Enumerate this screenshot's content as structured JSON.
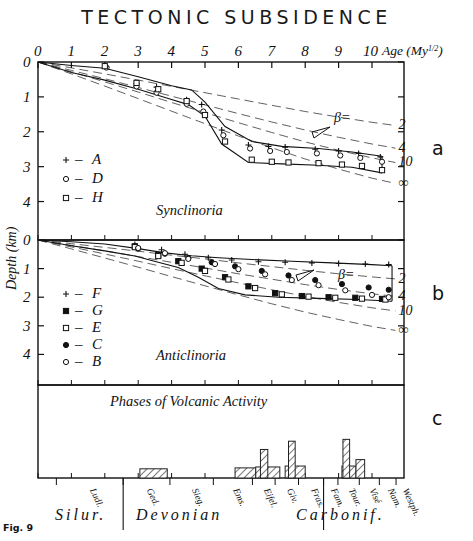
{
  "figure": {
    "title": "TECTONIC SUBSIDENCE",
    "fig_number": "Fig. 9",
    "x_axis_label": "Age (My",
    "x_axis_label_sup": "1/2",
    "x_axis_label_close": ")",
    "y_axis_label": "Depth (km)",
    "x_ticks": [
      "0",
      "1",
      "2",
      "3",
      "4",
      "5",
      "6",
      "7",
      "8",
      "9",
      "10"
    ],
    "y_ticks": [
      "0",
      "1",
      "2",
      "3",
      "4"
    ],
    "panel_letters": [
      "a",
      "b",
      "c"
    ]
  },
  "chart_data": {
    "type": "line",
    "title": "TECTONIC SUBSIDENCE",
    "xlabel": "Age (My^1/2)",
    "ylabel": "Depth (km)",
    "xlim": [
      0,
      11.1
    ],
    "ylim_panels_ab": [
      0,
      4.3
    ],
    "grid": false,
    "panels": [
      {
        "letter": "a",
        "caption": "Synclinoria",
        "legend_position": "inner-left",
        "legend": [
          {
            "symbol": "plus",
            "label": "A"
          },
          {
            "symbol": "open-circle",
            "label": "D"
          },
          {
            "symbol": "open-square",
            "label": "H"
          }
        ],
        "beta_label": "β=",
        "beta_values": [
          "2",
          "4",
          "10",
          "∞"
        ],
        "beta_curves": [
          {
            "name": "2",
            "x": [
              0,
              1,
              2,
              3,
              4,
              5,
              6,
              7,
              8,
              9,
              10,
              10.7
            ],
            "y": [
              0,
              0.17,
              0.34,
              0.52,
              0.7,
              0.88,
              1.06,
              1.24,
              1.42,
              1.58,
              1.73,
              1.82
            ]
          },
          {
            "name": "4",
            "x": [
              0,
              1,
              2,
              3,
              4,
              5,
              6,
              7,
              8,
              9,
              10,
              10.7
            ],
            "y": [
              0,
              0.24,
              0.48,
              0.73,
              0.98,
              1.23,
              1.48,
              1.72,
              1.95,
              2.16,
              2.35,
              2.47
            ]
          },
          {
            "name": "10",
            "x": [
              0,
              1,
              2,
              3,
              4,
              5,
              6,
              7,
              8,
              9,
              10,
              10.7
            ],
            "y": [
              0,
              0.28,
              0.57,
              0.86,
              1.16,
              1.45,
              1.74,
              2.02,
              2.29,
              2.53,
              2.75,
              2.88
            ]
          },
          {
            "name": "∞",
            "x": [
              0,
              1,
              2,
              3,
              4,
              5,
              6,
              7,
              8,
              9,
              10,
              10.7
            ],
            "y": [
              0,
              0.34,
              0.69,
              1.05,
              1.41,
              1.77,
              2.12,
              2.46,
              2.78,
              3.07,
              3.33,
              3.48
            ]
          }
        ],
        "envelope_upper": {
          "x": [
            0,
            1.0,
            2.0,
            3.0,
            4.0,
            4.6,
            5.0,
            5.6,
            6.4,
            7.3,
            8.4,
            9.4,
            10.3
          ],
          "y": [
            0,
            0.1,
            0.18,
            0.42,
            0.68,
            0.8,
            1.15,
            1.85,
            2.28,
            2.42,
            2.48,
            2.58,
            2.7
          ]
        },
        "envelope_lower": {
          "x": [
            0,
            1.0,
            2.0,
            3.0,
            3.9,
            4.5,
            5.0,
            5.5,
            6.3,
            7.3,
            8.4,
            9.4,
            10.3
          ],
          "y": [
            0,
            0.3,
            0.52,
            0.78,
            1.05,
            1.22,
            1.55,
            2.35,
            2.88,
            2.92,
            2.96,
            3.02,
            3.18
          ]
        },
        "series": [
          {
            "name": "A",
            "symbol": "plus",
            "x": [
              2.05,
              2.95,
              3.55,
              4.45,
              4.9,
              5.5,
              6.3,
              6.9,
              7.4,
              8.3,
              9.0,
              9.6,
              10.25
            ],
            "y": [
              0.14,
              0.62,
              0.72,
              1.08,
              1.22,
              1.95,
              2.38,
              2.42,
              2.44,
              2.5,
              2.55,
              2.62,
              2.72
            ]
          },
          {
            "name": "D",
            "symbol": "open-circle",
            "x": [
              2.05,
              2.95,
              3.55,
              4.45,
              4.95,
              5.55,
              6.35,
              6.95,
              7.45,
              8.35,
              9.05,
              9.65,
              10.3
            ],
            "y": [
              0.16,
              0.7,
              0.88,
              1.2,
              1.42,
              2.1,
              2.48,
              2.55,
              2.58,
              2.62,
              2.68,
              2.75,
              2.86
            ]
          },
          {
            "name": "H",
            "symbol": "open-square",
            "x": [
              2.0,
              2.95,
              3.6,
              4.45,
              5.0,
              5.6,
              6.4,
              7.0,
              7.5,
              8.4,
              9.1,
              9.7,
              10.3
            ],
            "y": [
              0.12,
              0.6,
              0.78,
              1.12,
              1.52,
              2.28,
              2.8,
              2.86,
              2.88,
              2.9,
              2.94,
              2.98,
              3.1
            ]
          }
        ]
      },
      {
        "letter": "b",
        "caption": "Anticlinoria",
        "legend_position": "inner-left",
        "legend": [
          {
            "symbol": "plus",
            "label": "F"
          },
          {
            "symbol": "filled-square",
            "label": "G"
          },
          {
            "symbol": "open-square",
            "label": "E"
          },
          {
            "symbol": "filled-circle",
            "label": "C"
          },
          {
            "symbol": "open-circle",
            "label": "B"
          }
        ],
        "beta_label": "β=",
        "beta_values": [
          "2",
          "4",
          "10",
          "∞"
        ],
        "beta_curves": [
          {
            "name": "2",
            "x": [
              0,
              1,
              2,
              3,
              4,
              5,
              6,
              7,
              8,
              9,
              10,
              10.7
            ],
            "y": [
              0,
              0.13,
              0.26,
              0.39,
              0.53,
              0.66,
              0.8,
              0.93,
              1.06,
              1.18,
              1.29,
              1.36
            ]
          },
          {
            "name": "4",
            "x": [
              0,
              1,
              2,
              3,
              4,
              5,
              6,
              7,
              8,
              9,
              10,
              10.7
            ],
            "y": [
              0,
              0.19,
              0.38,
              0.58,
              0.78,
              0.98,
              1.18,
              1.37,
              1.56,
              1.73,
              1.88,
              1.97
            ]
          },
          {
            "name": "10",
            "x": [
              0,
              1,
              2,
              3,
              4,
              5,
              6,
              7,
              8,
              9,
              10,
              10.7
            ],
            "y": [
              0,
              0.24,
              0.49,
              0.74,
              1.0,
              1.25,
              1.5,
              1.74,
              1.97,
              2.18,
              2.37,
              2.48
            ]
          },
          {
            "name": "∞",
            "x": [
              0,
              1,
              2,
              3,
              4,
              5,
              6,
              7,
              8,
              9,
              10,
              10.7
            ],
            "y": [
              0,
              0.31,
              0.63,
              0.95,
              1.28,
              1.6,
              1.92,
              2.23,
              2.52,
              2.78,
              3.02,
              3.16
            ]
          }
        ],
        "envelope_upper": {
          "x": [
            0,
            1.0,
            2.0,
            3.0,
            3.8,
            4.6,
            5.4,
            6.4,
            7.6,
            8.8,
            10.0,
            10.6
          ],
          "y": [
            0,
            0.06,
            0.14,
            0.3,
            0.45,
            0.55,
            0.62,
            0.68,
            0.74,
            0.8,
            0.86,
            0.9
          ]
        },
        "envelope_lower": {
          "x": [
            0,
            1.0,
            2.0,
            2.9,
            3.6,
            4.2,
            4.8,
            5.4,
            6.2,
            7.2,
            8.4,
            9.6,
            10.6
          ],
          "y": [
            0,
            0.2,
            0.38,
            0.56,
            0.78,
            0.96,
            1.3,
            1.7,
            1.92,
            2.0,
            2.04,
            2.08,
            2.14
          ]
        },
        "series": [
          {
            "name": "F",
            "symbol": "plus",
            "x": [
              2.9,
              3.7,
              4.4,
              5.1,
              5.8,
              6.6,
              7.4,
              8.2,
              9.0,
              9.8,
              10.5
            ],
            "y": [
              0.16,
              0.34,
              0.5,
              0.62,
              0.7,
              0.76,
              0.78,
              0.8,
              0.82,
              0.84,
              0.86
            ]
          },
          {
            "name": "G",
            "symbol": "filled-square",
            "x": [
              2.9,
              3.6,
              4.2,
              4.9,
              5.6,
              6.3,
              7.1,
              7.9,
              8.7,
              9.5,
              10.3
            ],
            "y": [
              0.22,
              0.52,
              0.74,
              1.0,
              1.3,
              1.62,
              1.86,
              1.96,
              2.0,
              2.02,
              2.06
            ]
          },
          {
            "name": "E",
            "symbol": "open-square",
            "x": [
              2.9,
              3.6,
              4.3,
              5.0,
              5.7,
              6.5,
              7.3,
              8.1,
              8.9,
              9.7,
              10.4
            ],
            "y": [
              0.25,
              0.56,
              0.8,
              1.08,
              1.38,
              1.68,
              1.9,
              1.98,
              2.02,
              2.05,
              2.08
            ]
          },
          {
            "name": "C",
            "symbol": "filled-circle",
            "x": [
              3.0,
              3.8,
              4.5,
              5.2,
              5.9,
              6.7,
              7.5,
              8.3,
              9.1,
              9.9,
              10.5
            ],
            "y": [
              0.3,
              0.48,
              0.64,
              0.78,
              0.92,
              1.08,
              1.24,
              1.4,
              1.54,
              1.66,
              1.74
            ]
          },
          {
            "name": "B",
            "symbol": "open-circle",
            "x": [
              3.0,
              3.8,
              4.5,
              5.3,
              6.0,
              6.8,
              7.6,
              8.4,
              9.2,
              10.0,
              10.5
            ],
            "y": [
              0.28,
              0.46,
              0.66,
              0.84,
              1.02,
              1.2,
              1.4,
              1.58,
              1.76,
              1.92,
              2.0
            ]
          }
        ]
      },
      {
        "letter": "c",
        "caption": "Phases of Volcanic Activity",
        "bars": [
          {
            "stage": "Ged.",
            "x": 3.05,
            "width": 0.82,
            "height": 0.2,
            "hatched": true
          },
          {
            "stage": "Ems.",
            "x": 5.9,
            "width": 0.62,
            "height": 0.22,
            "hatched": true
          },
          {
            "stage": "Eifel.",
            "x": 6.52,
            "width": 0.72,
            "height": 0.24,
            "hatched": true
          },
          {
            "stage": "Eifel-spike",
            "x": 6.66,
            "width": 0.22,
            "height": 0.62,
            "hatched": true
          },
          {
            "stage": "Giv.",
            "x": 7.4,
            "width": 0.6,
            "height": 0.26,
            "hatched": true
          },
          {
            "stage": "Giv-spike",
            "x": 7.5,
            "width": 0.2,
            "height": 0.8,
            "hatched": true
          },
          {
            "stage": "Tour.",
            "x": 9.1,
            "width": 0.42,
            "height": 0.26,
            "hatched": true
          },
          {
            "stage": "Tour-spike",
            "x": 9.13,
            "width": 0.2,
            "height": 0.84,
            "hatched": true
          },
          {
            "stage": "Tour-step",
            "x": 9.52,
            "width": 0.26,
            "height": 0.4,
            "hatched": true
          }
        ]
      }
    ],
    "stratigraphy": {
      "stages": [
        "Ludl.",
        "Ged.",
        "Sieg.",
        "Ems.",
        "Eifel.",
        "Giv.",
        "Fras.",
        "Fam.",
        "Tour.",
        "Visé",
        "Nam.",
        "Westph."
      ],
      "periods": [
        "Silur.",
        "Devonian",
        "Carbonif."
      ]
    }
  }
}
